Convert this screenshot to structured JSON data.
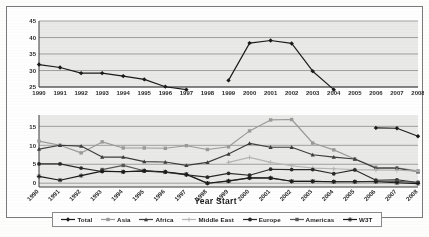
{
  "chart_data": {
    "type": "line",
    "title": "",
    "xlabel": "Year Start",
    "ylabel": "",
    "categories": [
      "1990",
      "1991",
      "1992",
      "1993",
      "1994",
      "1995",
      "1996",
      "1997",
      "1998",
      "1999",
      "2000",
      "2001",
      "2002",
      "2003",
      "2004",
      "2005",
      "2006",
      "2007",
      "2008"
    ],
    "panels": [
      {
        "name": "top-panel",
        "ylim": [
          25,
          45
        ],
        "yticks": [
          25,
          30,
          35,
          40,
          45
        ],
        "grid": true,
        "series": [
          {
            "name": "Total",
            "color": "#1a1a1a",
            "marker": "diamond",
            "values": [
              31.8,
              30.9,
              29.2,
              29.2,
              28.3,
              27.3,
              25.1,
              24.2,
              null,
              27.0,
              38.3,
              39.1,
              38.2,
              29.8,
              24.2,
              null,
              null,
              null,
              null
            ]
          }
        ]
      },
      {
        "name": "bottom-panel",
        "ylim": [
          -1,
          18
        ],
        "yticks": [
          0,
          5,
          10,
          15
        ],
        "grid": true,
        "series": [
          {
            "name": "Total",
            "color": "#1a1a1a",
            "marker": "diamond",
            "values": [
              null,
              null,
              null,
              null,
              null,
              null,
              null,
              null,
              null,
              null,
              null,
              null,
              null,
              null,
              null,
              null,
              14.6,
              14.5,
              12.4
            ]
          },
          {
            "name": "Asia",
            "color": "#9a9a9a",
            "marker": "square",
            "values": [
              11.1,
              10.0,
              8.0,
              10.9,
              9.3,
              9.3,
              9.2,
              9.9,
              8.9,
              9.6,
              13.8,
              16.7,
              16.8,
              10.6,
              8.8,
              6.4,
              4.2,
              4.1,
              3.3
            ]
          },
          {
            "name": "Africa",
            "color": "#3d3d3d",
            "marker": "triangle",
            "values": [
              9.0,
              10.0,
              9.8,
              6.9,
              6.9,
              5.7,
              5.6,
              4.7,
              5.5,
              7.7,
              10.5,
              9.5,
              9.5,
              7.5,
              6.9,
              6.4,
              4.0,
              4.0,
              3.0
            ]
          },
          {
            "name": "Middle East",
            "color": "#b5b5b5",
            "marker": "cross",
            "values": [
              null,
              null,
              null,
              null,
              null,
              null,
              null,
              null,
              null,
              5.5,
              6.8,
              5.5,
              4.6,
              4.0,
              3.8,
              3.6,
              3.5,
              3.4,
              3.2
            ]
          },
          {
            "name": "Europe",
            "color": "#2a2a2a",
            "marker": "circle",
            "values": [
              5.1,
              5.1,
              4.0,
              3.1,
              3.0,
              3.2,
              2.9,
              2.2,
              1.6,
              2.6,
              2.1,
              3.7,
              3.6,
              3.6,
              2.5,
              3.5,
              0.8,
              0.9,
              0.2
            ]
          },
          {
            "name": "Americas",
            "color": "#585858",
            "marker": "square",
            "values": [
              null,
              null,
              null,
              3.6,
              4.7,
              3.3,
              2.9,
              2.4,
              0.0,
              0.5,
              1.4,
              1.3,
              0.5,
              0.5,
              0.4,
              0.4,
              0.5,
              0.5,
              0.2
            ]
          },
          {
            "name": "W3T",
            "color": "#1a1a1a",
            "marker": "star",
            "values": [
              1.8,
              0.8,
              2.0,
              3.2,
              3.0,
              3.3,
              3.0,
              2.3,
              0.0,
              0.6,
              1.4,
              1.4,
              0.5,
              0.5,
              0.4,
              0.4,
              0.4,
              0.1,
              -0.1
            ]
          }
        ]
      }
    ],
    "legend": {
      "position": "bottom",
      "entries": [
        {
          "label": "Total",
          "color": "#1a1a1a",
          "marker": "diamond"
        },
        {
          "label": "Asia",
          "color": "#9a9a9a",
          "marker": "square"
        },
        {
          "label": "Africa",
          "color": "#3d3d3d",
          "marker": "triangle"
        },
        {
          "label": "Middle East",
          "color": "#b5b5b5",
          "marker": "cross"
        },
        {
          "label": "Europe",
          "color": "#2a2a2a",
          "marker": "circle"
        },
        {
          "label": "Americas",
          "color": "#585858",
          "marker": "square"
        },
        {
          "label": "W3T",
          "color": "#1a1a1a",
          "marker": "star"
        }
      ]
    }
  }
}
